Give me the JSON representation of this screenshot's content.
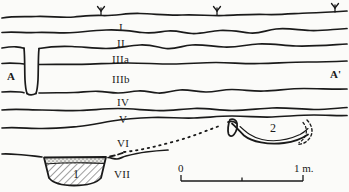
{
  "figure": {
    "kind": "archaeological-stratigraphic-section",
    "width": 349,
    "height": 192,
    "background_color": "#fbfbf9",
    "ink_color": "#1a1a1a"
  },
  "section_ends": {
    "left_label": "A",
    "right_label": "A'"
  },
  "layers": [
    {
      "id": "I",
      "label": "I",
      "x": 119,
      "y": 22
    },
    {
      "id": "II",
      "label": "II",
      "x": 117,
      "y": 41
    },
    {
      "id": "IIIa",
      "label": "IIIa",
      "x": 112,
      "y": 58
    },
    {
      "id": "IIIb",
      "label": "IIIb",
      "x": 112,
      "y": 78
    },
    {
      "id": "IV",
      "label": "IV",
      "x": 117,
      "y": 101
    },
    {
      "id": "V",
      "label": "V",
      "x": 119,
      "y": 118
    },
    {
      "id": "VI",
      "label": "VI",
      "x": 117,
      "y": 142
    },
    {
      "id": "VII",
      "label": "VII",
      "x": 116,
      "y": 172
    }
  ],
  "features": [
    {
      "id": "1",
      "label": "1",
      "x": 76,
      "y": 172,
      "kind": "hatched-pit"
    },
    {
      "id": "2",
      "label": "2",
      "x": 273,
      "y": 128,
      "kind": "basin-pit"
    }
  ],
  "vegetation_symbols": [
    {
      "name": "grass-symbol",
      "x": 101,
      "y": 9
    },
    {
      "name": "grass-symbol",
      "x": 217,
      "y": 7
    },
    {
      "name": "grass-symbol",
      "x": 335,
      "y": 6
    }
  ],
  "scale_bar": {
    "start_label": "0",
    "end_label": "1 m.",
    "unit": "m",
    "length_value": 1,
    "x_start": 181,
    "x_end": 303,
    "y": 180,
    "ticks": [
      0,
      0.5,
      1
    ]
  }
}
